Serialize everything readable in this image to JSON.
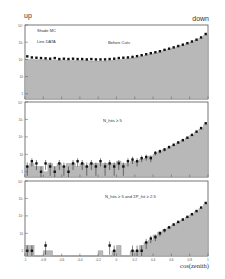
{
  "figure": {
    "corner_left": "up",
    "corner_right": "down",
    "ylabel": "number of events",
    "xlabel": "cos(zenith)",
    "legend": {
      "shaded": "Shade  MC",
      "line": "Line  DATA"
    }
  },
  "chart_data": [
    {
      "type": "bar",
      "title": "Before Cuts",
      "xlabel": "cos(zenith)",
      "ylabel": "number of events",
      "yscale": "log",
      "ylim": [
        0.5,
        10000
      ],
      "xlim": [
        -1,
        1
      ],
      "legend": [
        "Shade MC",
        "Line DATA"
      ],
      "x": [
        -0.975,
        -0.925,
        -0.875,
        -0.825,
        -0.775,
        -0.725,
        -0.675,
        -0.625,
        -0.575,
        -0.525,
        -0.475,
        -0.425,
        -0.375,
        -0.325,
        -0.275,
        -0.225,
        -0.175,
        -0.125,
        -0.075,
        -0.025,
        0.025,
        0.075,
        0.125,
        0.175,
        0.225,
        0.275,
        0.325,
        0.375,
        0.425,
        0.475,
        0.525,
        0.575,
        0.625,
        0.675,
        0.725,
        0.775,
        0.825,
        0.875,
        0.925,
        0.975
      ],
      "series": [
        {
          "name": "MC",
          "values": [
            100,
            100,
            95,
            95,
            95,
            90,
            90,
            90,
            90,
            85,
            85,
            85,
            85,
            85,
            80,
            80,
            80,
            80,
            85,
            90,
            95,
            100,
            110,
            120,
            130,
            150,
            170,
            200,
            230,
            270,
            320,
            380,
            450,
            550,
            650,
            800,
            1000,
            1300,
            1700,
            2500
          ]
        },
        {
          "name": "DATA",
          "values": [
            150,
            130,
            125,
            120,
            115,
            110,
            120,
            105,
            110,
            105,
            110,
            105,
            105,
            100,
            105,
            100,
            100,
            100,
            105,
            110,
            120,
            125,
            130,
            140,
            155,
            175,
            200,
            230,
            260,
            300,
            360,
            420,
            500,
            600,
            720,
            880,
            1100,
            1400,
            1900,
            3000
          ]
        }
      ]
    },
    {
      "type": "bar",
      "title": "N_hits ≥ 5",
      "xlabel": "cos(zenith)",
      "ylabel": "number of events",
      "yscale": "log",
      "ylim": [
        0.5,
        10000
      ],
      "xlim": [
        -1,
        1
      ],
      "x": [
        -0.975,
        -0.925,
        -0.875,
        -0.825,
        -0.775,
        -0.725,
        -0.675,
        -0.625,
        -0.575,
        -0.525,
        -0.475,
        -0.425,
        -0.375,
        -0.325,
        -0.275,
        -0.225,
        -0.175,
        -0.125,
        -0.075,
        -0.025,
        0.025,
        0.075,
        0.125,
        0.175,
        0.225,
        0.275,
        0.325,
        0.375,
        0.425,
        0.475,
        0.525,
        0.575,
        0.625,
        0.675,
        0.725,
        0.775,
        0.825,
        0.875,
        0.925,
        0.975
      ],
      "series": [
        {
          "name": "MC",
          "values": [
            2,
            3,
            2,
            2,
            1,
            3,
            2,
            3,
            2,
            3,
            3,
            2,
            3,
            2,
            3,
            3,
            3,
            3,
            3,
            3,
            4,
            3,
            3,
            4,
            4,
            5,
            6,
            8,
            10,
            14,
            18,
            24,
            32,
            45,
            60,
            85,
            120,
            180,
            280,
            500
          ]
        },
        {
          "name": "DATA",
          "values": [
            2,
            4,
            3,
            1,
            3,
            2,
            1,
            3,
            2,
            1,
            3,
            4,
            3,
            2,
            3,
            2,
            4,
            2,
            3,
            2,
            3,
            2,
            4,
            5,
            4,
            6,
            7,
            6,
            12,
            15,
            19,
            26,
            35,
            48,
            65,
            90,
            130,
            200,
            320,
            600
          ]
        }
      ]
    },
    {
      "type": "bar",
      "title": "N_hits ≥ 5 and ΣP_hit ≥ 2.5",
      "xlabel": "cos(zenith)",
      "ylabel": "number of events",
      "yscale": "log",
      "ylim": [
        0.5,
        10000
      ],
      "xlim": [
        -1,
        1
      ],
      "x": [
        -0.975,
        -0.925,
        -0.875,
        -0.825,
        -0.775,
        -0.725,
        -0.675,
        -0.625,
        -0.575,
        -0.525,
        -0.475,
        -0.425,
        -0.375,
        -0.325,
        -0.275,
        -0.225,
        -0.175,
        -0.125,
        -0.075,
        -0.025,
        0.025,
        0.075,
        0.125,
        0.175,
        0.225,
        0.275,
        0.325,
        0.375,
        0.425,
        0.475,
        0.525,
        0.575,
        0.625,
        0.675,
        0.725,
        0.775,
        0.825,
        0.875,
        0.925,
        0.975
      ],
      "series": [
        {
          "name": "MC",
          "values": [
            2,
            2,
            0,
            0,
            1,
            1,
            0,
            0,
            0,
            0,
            0,
            0,
            0,
            0,
            0,
            0,
            1,
            0,
            0,
            1,
            2,
            0,
            0,
            1,
            1,
            2,
            3,
            4,
            8,
            12,
            16,
            22,
            30,
            42,
            58,
            80,
            115,
            170,
            260,
            450
          ]
        },
        {
          "name": "DATA",
          "values": [
            1,
            1,
            0,
            0,
            2,
            0,
            0,
            0,
            0,
            0,
            0,
            0,
            0,
            0,
            0,
            0,
            0,
            0,
            2,
            1,
            0,
            0,
            0,
            1,
            1,
            1,
            3,
            5,
            6,
            10,
            15,
            22,
            32,
            45,
            62,
            88,
            125,
            190,
            300,
            550
          ]
        }
      ]
    }
  ],
  "axes": {
    "x_ticks": [
      "-1",
      "-0.8",
      "-0.6",
      "-0.4",
      "-0.2",
      "0",
      "0.2",
      "0.4",
      "0.6",
      "0.8",
      "1"
    ],
    "y_ticks": [
      "1",
      "10",
      "10²",
      "10³",
      "10⁴"
    ]
  }
}
